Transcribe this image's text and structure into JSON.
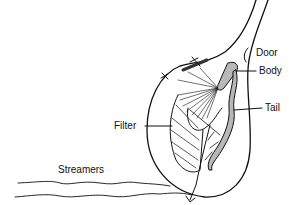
{
  "diagram": {
    "labels": {
      "door": "Door",
      "body": "Body",
      "tail": "Tail",
      "filter": "Filter",
      "streamers": "Streamers"
    },
    "colors": {
      "stroke": "#111111",
      "fill_animal": "#b8b8b8",
      "background": "#ffffff"
    }
  }
}
